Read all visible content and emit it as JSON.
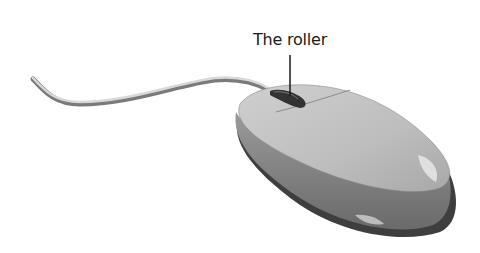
{
  "figure": {
    "label": "The roller",
    "colors": {
      "background": "#ffffff",
      "body_light": "#c8c8c8",
      "body_mid": "#a9a9a9",
      "body_dark": "#6e6e6e",
      "edge": "#4a4a4a",
      "roller": "#3a3a3a",
      "cable": "#bdbdbd",
      "text": "#1a1a1a"
    }
  }
}
